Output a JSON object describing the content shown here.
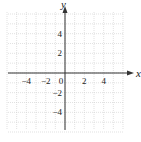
{
  "chart_data": {
    "type": "scatter",
    "title": "",
    "xlabel": "x",
    "ylabel": "y",
    "xlim": [
      -6,
      6
    ],
    "ylim": [
      -6,
      6
    ],
    "grid": true,
    "x_ticks": [
      -4,
      -2,
      0,
      2,
      4
    ],
    "y_ticks": [
      4,
      2,
      -2,
      -4
    ],
    "x_tick_labels": [
      "−4",
      "−2",
      "0",
      "2",
      "4"
    ],
    "y_tick_labels": [
      "4",
      "2",
      "−2",
      "−4"
    ],
    "series": []
  }
}
